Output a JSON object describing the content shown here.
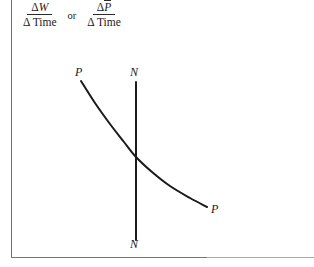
{
  "figure": {
    "type": "economics-diagram"
  },
  "axes": {
    "y_label": {
      "fraction_1": {
        "numerator_delta": "Δ",
        "numerator_var": "W",
        "denominator_delta": "Δ",
        "denominator_var": "Time"
      },
      "connector": "or",
      "fraction_2": {
        "numerator_delta": "Δ",
        "numerator_var": "P",
        "numerator_var_has_overbar": true,
        "denominator_delta": "Δ",
        "denominator_var": "Time"
      }
    },
    "x_axis_label": "",
    "line_color": "#6d6d6d",
    "baseline_color": "#a9a9a9"
  },
  "curves": {
    "pp": {
      "label_top": "P",
      "label_bottom": "P",
      "color": "#1a1a1a",
      "stroke_width": 2.0,
      "shape": "convex-decreasing"
    },
    "nn": {
      "label_top": "N",
      "label_bottom": "N",
      "color": "#1a1a1a",
      "stroke_width": 2.0,
      "shape": "vertical"
    }
  },
  "chart_data": {
    "type": "line",
    "title": "",
    "xlabel": "",
    "ylabel": "ΔW/Δ Time  or  ΔP̄/Δ Time",
    "grid": false,
    "legend": "inline-curve-labels",
    "xlim": [
      0,
      314
    ],
    "ylim": [
      267,
      0
    ],
    "series": [
      {
        "name": "PP",
        "kind": "curve",
        "points": [
          [
            81,
            81
          ],
          [
            95,
            103
          ],
          [
            110,
            124
          ],
          [
            124,
            142
          ],
          [
            136,
            157
          ],
          [
            152,
            172
          ],
          [
            170,
            186
          ],
          [
            190,
            198
          ],
          [
            207,
            207
          ]
        ]
      },
      {
        "name": "NN",
        "kind": "vertical-line",
        "points": [
          [
            136,
            82
          ],
          [
            136,
            240
          ]
        ]
      }
    ],
    "annotations": [
      {
        "text": "P",
        "x": 78,
        "y": 73,
        "series": "PP"
      },
      {
        "text": "N",
        "x": 133,
        "y": 73,
        "series": "NN"
      },
      {
        "text": "P",
        "x": 214,
        "y": 210,
        "series": "PP"
      },
      {
        "text": "N",
        "x": 133,
        "y": 245,
        "series": "NN"
      }
    ]
  }
}
